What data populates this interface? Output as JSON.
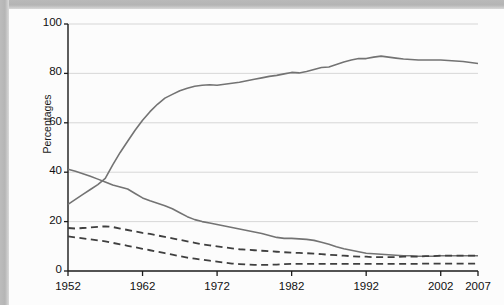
{
  "figure": {
    "background_color": "#fcfcfc",
    "border_color": "#b6b6b6",
    "ylabel": "Percentages"
  },
  "chart_data": {
    "type": "line",
    "title": "",
    "xlabel": "",
    "ylabel": "Percentages",
    "xlim": [
      1952,
      2007
    ],
    "ylim": [
      0,
      100
    ],
    "grid": true,
    "grid_axis": "y",
    "legend": "none",
    "xticks": [
      "1952",
      "1962",
      "1972",
      "1982",
      "1992",
      "2002",
      "2007"
    ],
    "xtick_values": [
      1952,
      1962,
      1972,
      1982,
      1992,
      2002,
      2007
    ],
    "yticks": [
      "0",
      "20",
      "40",
      "60",
      "80",
      "100"
    ],
    "ytick_values": [
      0,
      20,
      40,
      60,
      80,
      100
    ],
    "x": [
      1952,
      1953,
      1954,
      1955,
      1956,
      1957,
      1958,
      1959,
      1960,
      1961,
      1962,
      1963,
      1964,
      1965,
      1966,
      1967,
      1968,
      1969,
      1970,
      1971,
      1972,
      1973,
      1974,
      1975,
      1976,
      1977,
      1978,
      1979,
      1980,
      1981,
      1982,
      1983,
      1984,
      1985,
      1986,
      1987,
      1988,
      1989,
      1990,
      1991,
      1992,
      1993,
      1994,
      1995,
      1996,
      1997,
      1998,
      1999,
      2000,
      2001,
      2002,
      2003,
      2004,
      2005,
      2006,
      2007
    ],
    "series": [
      {
        "name": "rising-solid",
        "style": "solid",
        "color": "#737373",
        "width": 1.6,
        "values": [
          27.0,
          29.0,
          31.0,
          33.0,
          35.0,
          37.5,
          43.0,
          48.0,
          52.5,
          57.0,
          61.0,
          64.5,
          67.5,
          70.0,
          71.5,
          73.0,
          74.0,
          74.8,
          75.2,
          75.4,
          75.2,
          75.6,
          76.0,
          76.4,
          77.0,
          77.6,
          78.2,
          78.8,
          79.2,
          79.8,
          80.4,
          80.2,
          80.8,
          81.6,
          82.4,
          82.6,
          83.6,
          84.6,
          85.4,
          86.0,
          86.0,
          86.6,
          87.0,
          86.6,
          86.2,
          85.8,
          85.6,
          85.4,
          85.4,
          85.4,
          85.4,
          85.2,
          85.0,
          84.8,
          84.4,
          84.0
        ]
      },
      {
        "name": "declining-solid",
        "style": "solid",
        "color": "#737373",
        "width": 1.6,
        "values": [
          41.2,
          40.4,
          39.4,
          38.4,
          37.2,
          36.0,
          34.8,
          34.0,
          33.2,
          31.4,
          29.6,
          28.4,
          27.4,
          26.4,
          25.2,
          23.6,
          22.0,
          20.8,
          20.0,
          19.4,
          18.8,
          18.2,
          17.6,
          17.0,
          16.4,
          15.8,
          15.2,
          14.4,
          13.6,
          13.2,
          13.2,
          13.0,
          12.8,
          12.4,
          11.6,
          10.8,
          9.8,
          9.0,
          8.4,
          7.8,
          7.2,
          7.0,
          6.8,
          6.6,
          6.4,
          6.2,
          6.2,
          6.0,
          6.0,
          6.0,
          6.2,
          6.2,
          6.2,
          6.2,
          6.2,
          6.2
        ]
      },
      {
        "name": "dashed-upper",
        "style": "dashed",
        "color": "#3f3f3f",
        "width": 1.8,
        "values": [
          17.4,
          17.2,
          17.4,
          17.6,
          17.9,
          18.1,
          17.8,
          17.2,
          16.6,
          16.0,
          15.4,
          15.0,
          14.4,
          13.8,
          13.2,
          12.6,
          12.0,
          11.4,
          10.8,
          10.4,
          10.0,
          9.6,
          9.2,
          8.8,
          8.6,
          8.4,
          8.2,
          8.0,
          7.8,
          7.6,
          7.4,
          7.3,
          7.2,
          7.0,
          6.8,
          6.6,
          6.4,
          6.2,
          6.0,
          5.8,
          5.8,
          5.6,
          5.6,
          5.6,
          5.6,
          5.8,
          5.8,
          5.8,
          6.0,
          6.0,
          6.2,
          6.2,
          6.2,
          6.2,
          6.2,
          6.2
        ]
      },
      {
        "name": "dashed-lower",
        "style": "dashed",
        "color": "#3f3f3f",
        "width": 1.8,
        "values": [
          14.0,
          13.6,
          13.2,
          12.8,
          12.4,
          12.0,
          11.4,
          10.8,
          10.2,
          9.6,
          9.0,
          8.4,
          7.8,
          7.2,
          6.6,
          6.0,
          5.4,
          5.0,
          4.6,
          4.2,
          3.8,
          3.4,
          3.0,
          2.8,
          2.6,
          2.5,
          2.5,
          2.5,
          2.6,
          2.8,
          2.9,
          2.9,
          2.9,
          2.9,
          2.9,
          2.9,
          2.9,
          2.9,
          2.9,
          2.9,
          2.9,
          2.9,
          2.9,
          2.9,
          2.9,
          2.9,
          2.9,
          2.9,
          3.0,
          3.0,
          3.0,
          3.0,
          3.0,
          3.0,
          3.0,
          3.0
        ]
      }
    ]
  }
}
